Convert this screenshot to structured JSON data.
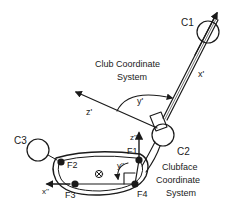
{
  "diagram": {
    "type": "golf club coordinate systems",
    "labels": {
      "c1": "C1",
      "c2": "C2",
      "c3": "C3",
      "f1": "F1",
      "f2": "F2",
      "f3": "F3",
      "f4": "F4",
      "club_system_line1": "Club Coordinate",
      "club_system_line2": "System",
      "clubface_system_line1": "Clubface",
      "clubface_system_line2": "Coordinate",
      "clubface_system_line3": "System",
      "x_prime": "x'",
      "y_prime": "y'",
      "z_prime": "z'",
      "x_double_prime": "x''",
      "y_double_prime": "y''",
      "z_double_prime": "z''"
    },
    "colors": {
      "ink": "#1a1a1a",
      "background": "#ffffff"
    }
  }
}
